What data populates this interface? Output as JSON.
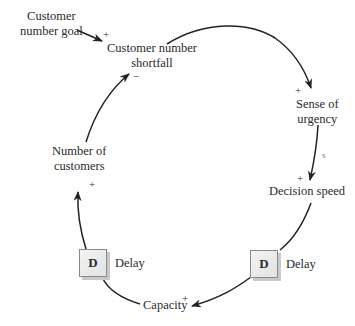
{
  "diagram": {
    "type": "causal-loop",
    "nodes": {
      "customer_number_goal": "Customer\nnumber goal",
      "customer_number_goal_l1": "Customer",
      "customer_number_goal_l2": "number goal",
      "customer_number_shortfall_l1": "Customer number",
      "customer_number_shortfall_l2": "shortfall",
      "sense_of_urgency_l1": "Sense of",
      "sense_of_urgency_l2": "urgency",
      "decision_speed": "Decision speed",
      "capacity": "Capacity",
      "number_of_customers_l1": "Number of",
      "number_of_customers_l2": "customers"
    },
    "links": [
      {
        "from": "Customer number goal",
        "to": "Customer number shortfall",
        "polarity": "+"
      },
      {
        "from": "Customer number shortfall",
        "to": "Sense of urgency",
        "polarity": "+"
      },
      {
        "from": "Sense of urgency",
        "to": "Decision speed",
        "polarity": "+",
        "note": "s"
      },
      {
        "from": "Decision speed",
        "to": "Capacity",
        "polarity": "+",
        "delay": true
      },
      {
        "from": "Capacity",
        "to": "Number of customers",
        "polarity": "+",
        "delay": true
      },
      {
        "from": "Number of customers",
        "to": "Customer number shortfall",
        "polarity": "−"
      }
    ],
    "signs": {
      "goal_to_shortfall": "+",
      "shortfall_to_urgency": "+",
      "urgency_note": "s",
      "urgency_to_decision": "+",
      "decision_to_capacity": "+",
      "capacity_to_customers": "+",
      "customers_to_shortfall": "−"
    },
    "delays": [
      {
        "box": "D",
        "label": "Delay"
      },
      {
        "box": "D",
        "label": "Delay"
      }
    ],
    "colors": {
      "line": "#222222",
      "box_fill": "#ebebeb",
      "box_border": "#8a8a8a",
      "box_shadow": "#c9c9c9"
    }
  }
}
